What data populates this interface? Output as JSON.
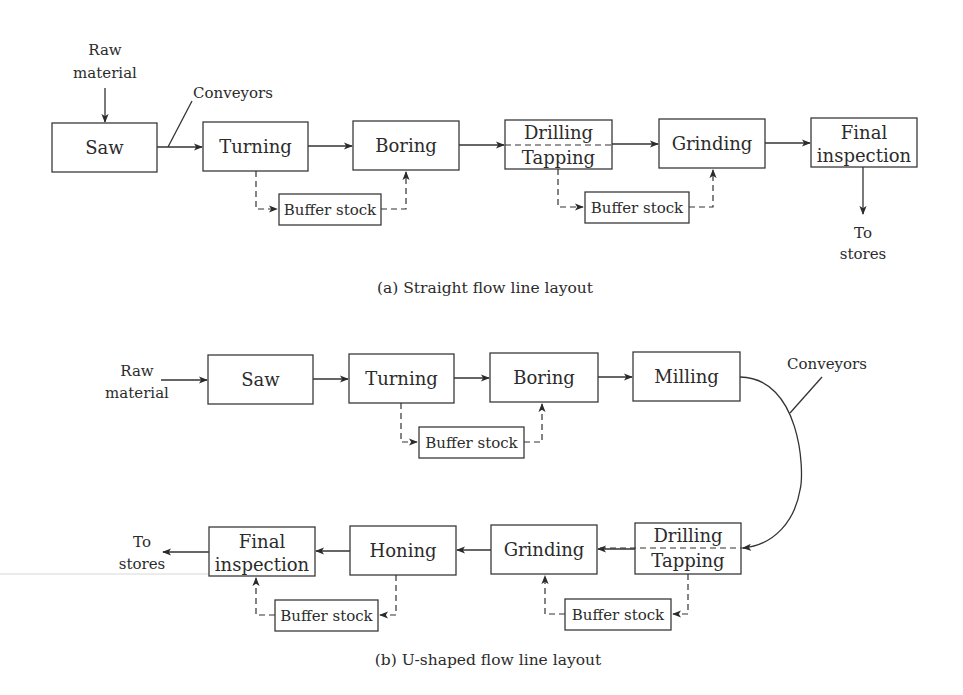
{
  "diagram": {
    "panel_a": {
      "caption": "(a) Straight flow line layout",
      "input_label": [
        "Raw",
        "material"
      ],
      "conveyor_label": "Conveyors",
      "output_label": [
        "To",
        "stores"
      ],
      "stations": [
        {
          "id": "saw",
          "lines": [
            "Saw"
          ],
          "x": 52,
          "y": 123,
          "w": 105,
          "h": 49
        },
        {
          "id": "turning",
          "lines": [
            "Turning"
          ],
          "x": 203,
          "y": 122,
          "w": 105,
          "h": 49
        },
        {
          "id": "boring",
          "lines": [
            "Boring"
          ],
          "x": 353,
          "y": 121,
          "w": 106,
          "h": 49
        },
        {
          "id": "drilling-tapping",
          "lines": [
            "Drilling",
            "Tapping"
          ],
          "x": 505,
          "y": 120,
          "w": 107,
          "h": 49,
          "split": true
        },
        {
          "id": "grinding",
          "lines": [
            "Grinding"
          ],
          "x": 659,
          "y": 119,
          "w": 106,
          "h": 49
        },
        {
          "id": "final-inspection",
          "lines": [
            "Final",
            "inspection"
          ],
          "x": 811,
          "y": 118,
          "w": 106,
          "h": 49
        }
      ],
      "buffers": [
        {
          "label": "Buffer stock",
          "x": 279,
          "y": 194,
          "w": 102,
          "h": 31,
          "from_x": 256,
          "to_x": 406
        },
        {
          "label": "Buffer stock",
          "x": 585,
          "y": 192,
          "w": 104,
          "h": 31,
          "from_x": 558,
          "to_x": 713
        }
      ]
    },
    "panel_b": {
      "caption": "(b) U-shaped flow line layout",
      "input_label": [
        "Raw",
        "material"
      ],
      "conveyor_label": "Conveyors",
      "output_label": [
        "To",
        "stores"
      ],
      "top_stations": [
        {
          "id": "saw",
          "lines": [
            "Saw"
          ],
          "x": 208,
          "y": 355,
          "w": 105,
          "h": 49
        },
        {
          "id": "turning",
          "lines": [
            "Turning"
          ],
          "x": 349,
          "y": 354,
          "w": 105,
          "h": 49
        },
        {
          "id": "boring",
          "lines": [
            "Boring"
          ],
          "x": 490,
          "y": 353,
          "w": 108,
          "h": 49
        },
        {
          "id": "milling",
          "lines": [
            "Milling"
          ],
          "x": 633,
          "y": 352,
          "w": 107,
          "h": 49
        }
      ],
      "bottom_stations": [
        {
          "id": "final-inspection",
          "lines": [
            "Final",
            "inspection"
          ],
          "x": 209,
          "y": 527,
          "w": 106,
          "h": 49
        },
        {
          "id": "honing",
          "lines": [
            "Honing"
          ],
          "x": 350,
          "y": 526,
          "w": 106,
          "h": 49
        },
        {
          "id": "grinding",
          "lines": [
            "Grinding"
          ],
          "x": 491,
          "y": 525,
          "w": 106,
          "h": 49
        },
        {
          "id": "drilling-tapping",
          "lines": [
            "Drilling",
            "Tapping"
          ],
          "x": 635,
          "y": 523,
          "w": 106,
          "h": 51,
          "split": true
        }
      ],
      "buffers": [
        {
          "label": "Buffer stock",
          "x": 419,
          "y": 427,
          "w": 105,
          "h": 31,
          "dir": "right",
          "from_x": 401,
          "to_x": 542
        },
        {
          "label": "Buffer stock",
          "x": 275,
          "y": 600,
          "w": 103,
          "h": 31,
          "dir": "left",
          "from_x": 396,
          "to_x": 256
        },
        {
          "label": "Buffer stock",
          "x": 565,
          "y": 599,
          "w": 106,
          "h": 31,
          "dir": "left",
          "from_x": 688,
          "to_x": 545
        }
      ]
    },
    "colors": {
      "stroke": "#333333",
      "text": "#2b2b2b",
      "background": "#ffffff"
    }
  }
}
